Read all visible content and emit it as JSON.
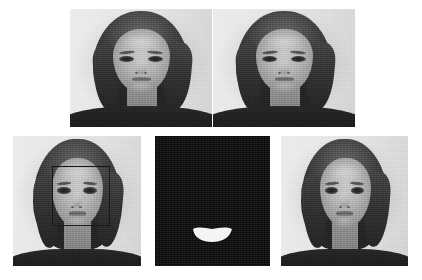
{
  "figure": {
    "background_color": "#ffffff",
    "width": 422,
    "height": 280,
    "colorspace": "grayscale",
    "rows": [
      {
        "row_index": 1,
        "panel_count": 2,
        "description": "Two input portrait photographs of a smiling woman facing the camera"
      },
      {
        "row_index": 2,
        "panel_count": 3,
        "description": "Detected face bounding box, binary mouth segmentation mask, and output portrait"
      }
    ]
  },
  "panels": [
    {
      "id": "panel-top-left",
      "name": "input-portrait-1",
      "caption": "",
      "row": 1,
      "column": 1,
      "type": "photograph",
      "content": "Grayscale frontal portrait of a smiling woman with long dark hair and dark top against a light wall",
      "x": 70,
      "y": 9,
      "width": 142,
      "height": 118,
      "has_overlay": false
    },
    {
      "id": "panel-top-right",
      "name": "input-portrait-2",
      "caption": "",
      "row": 1,
      "column": 2,
      "type": "photograph",
      "content": "Grayscale frontal portrait of the same smiling woman, second exposure",
      "x": 213,
      "y": 9,
      "width": 142,
      "height": 118,
      "has_overlay": false
    },
    {
      "id": "panel-bottom-left",
      "name": "face-detection-result",
      "caption": "",
      "row": 2,
      "column": 1,
      "type": "photograph-with-detection-box",
      "content": "Portrait with a rectangular face detection bounding box drawn around the facial region",
      "x": 13,
      "y": 136,
      "width": 128,
      "height": 130,
      "has_overlay": true,
      "overlay": {
        "type": "bounding-box",
        "label": "face-bounding-box",
        "stroke_color": "#1b1b1b",
        "stroke_width": 1,
        "x": 39,
        "y": 30,
        "width": 58,
        "height": 60
      }
    },
    {
      "id": "panel-bottom-middle",
      "name": "mouth-segmentation-mask",
      "caption": "",
      "row": 2,
      "column": 2,
      "type": "binary-mask",
      "content": "Binary segmentation mask: white lip/mouth region isolated on a black background",
      "x": 155,
      "y": 136,
      "width": 115,
      "height": 130,
      "background_color": "#0d0d0d",
      "foreground_color": "#f4f4f2",
      "has_overlay": false,
      "mask_region": {
        "label": "mouth-region",
        "shape": "lips",
        "center_x": 0.495,
        "center_y": 0.755,
        "width": 0.34,
        "height": 0.115
      }
    },
    {
      "id": "panel-bottom-right",
      "name": "output-portrait",
      "caption": "",
      "row": 2,
      "column": 3,
      "type": "photograph",
      "content": "Grayscale frontal portrait of the woman, final output view",
      "x": 281,
      "y": 136,
      "width": 127,
      "height": 130,
      "has_overlay": false
    }
  ]
}
